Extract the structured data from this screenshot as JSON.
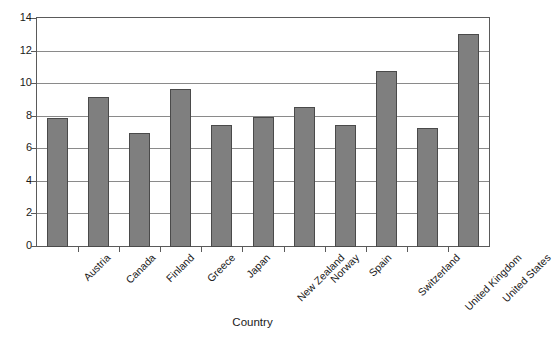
{
  "chart_data": {
    "type": "bar",
    "title": "",
    "subtitle": "",
    "xlabel": "Country",
    "ylabel": "",
    "categories": [
      "Austria",
      "Canada",
      "Finland",
      "Greece",
      "Japan",
      "New Zealand",
      "Norway",
      "Spain",
      "Switzerland",
      "United Kingdom",
      "United States"
    ],
    "values": [
      7.9,
      9.2,
      7.0,
      9.7,
      7.5,
      8.0,
      8.6,
      7.5,
      10.8,
      7.3,
      13.1
    ],
    "ylim": [
      0,
      14
    ],
    "ytick_labels": [
      "0",
      "2",
      "4",
      "6",
      "8",
      "10",
      "12",
      "14"
    ],
    "ytick_values": [
      0,
      2,
      4,
      6,
      8,
      10,
      12,
      14
    ],
    "grid": "horizontal",
    "legend": "none",
    "bar_color": "#7f7f7f",
    "bar_edge_color": "#4a4a4a",
    "grid_color": "#8a8a8a",
    "frame_color": "#5a5a5a",
    "background": "#ffffff"
  },
  "axis": {
    "x_title": "Country"
  }
}
